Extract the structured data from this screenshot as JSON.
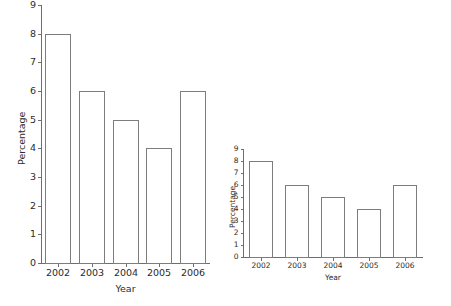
{
  "figure": {
    "background": "#ffffff",
    "ink_color": "#6e6e6e",
    "text_color": "#2b2b2b"
  },
  "chart_data": [
    {
      "id": "left",
      "type": "bar",
      "title": "",
      "xlabel": "Year",
      "ylabel": "Percentage",
      "categories": [
        "2002",
        "2003",
        "2004",
        "2005",
        "2006"
      ],
      "values": [
        8,
        6,
        5,
        4,
        6
      ],
      "yticks": [
        0,
        1,
        2,
        3,
        4,
        5,
        6,
        7,
        8,
        9
      ],
      "ytick_labels": [
        "0",
        "1",
        "2",
        "3",
        "4",
        "5",
        "6",
        "7",
        "8",
        "9"
      ],
      "ylim": [
        0,
        9
      ],
      "grid": false,
      "legend": "none",
      "bar_fill": "#ffffff",
      "bar_edge": "#7d7d7d"
    },
    {
      "id": "right",
      "type": "bar",
      "title": "",
      "xlabel": "Year",
      "ylabel": "Percentage",
      "categories": [
        "2002",
        "2003",
        "2004",
        "2005",
        "2006"
      ],
      "values": [
        8,
        6,
        5,
        4,
        6
      ],
      "yticks": [
        0,
        1,
        2,
        3,
        4,
        5,
        6,
        7,
        8,
        9
      ],
      "ytick_labels": [
        "0",
        "1",
        "2",
        "3",
        "4",
        "5",
        "6",
        "7",
        "8",
        "9"
      ],
      "ylim": [
        0,
        9
      ],
      "grid": false,
      "legend": "none",
      "bar_fill": "#ffffff",
      "bar_edge": "#7d7d7d"
    }
  ]
}
